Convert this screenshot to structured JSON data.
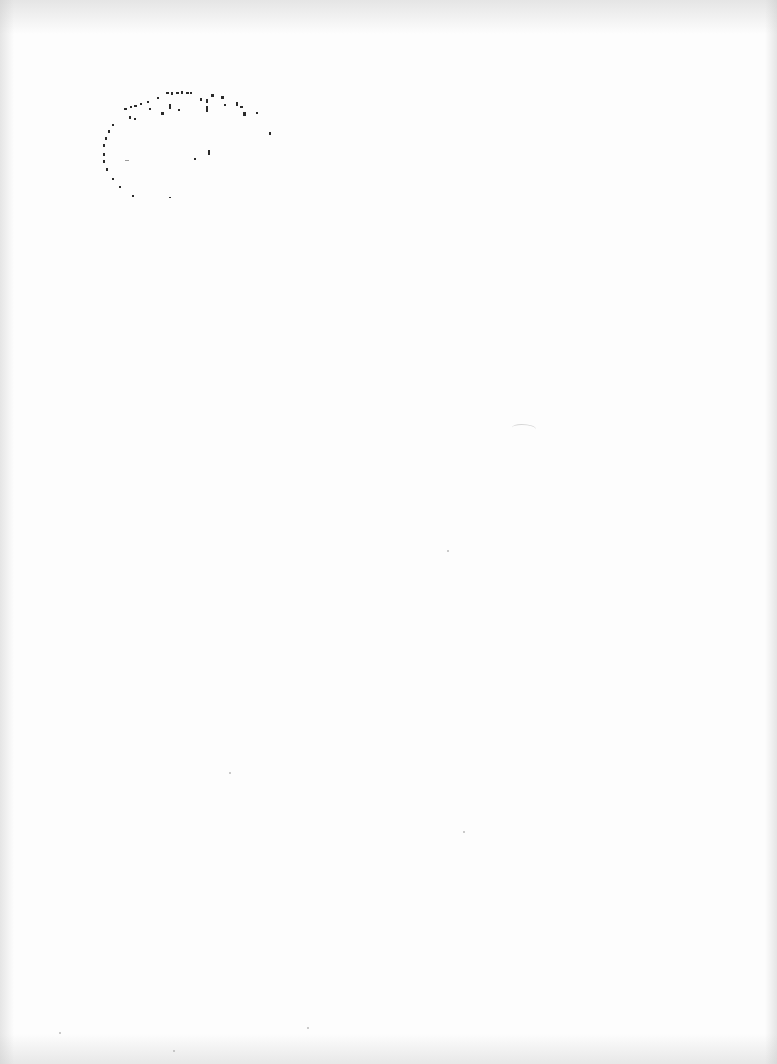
{
  "document": {
    "type": "scanned-page",
    "background_color": "#fdfdfd",
    "text": "",
    "stamp": {
      "shape": "oval",
      "legible_text": "",
      "ink_color": "#2a2a2a",
      "condition": "faded, illegible speckles"
    }
  }
}
